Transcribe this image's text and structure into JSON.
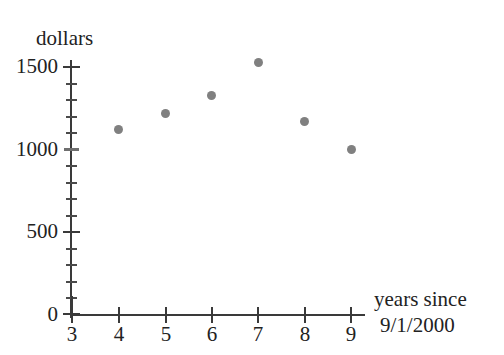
{
  "chart_data": {
    "type": "scatter",
    "title": "",
    "xlabel": "years since 9/1/2000",
    "xlabel_lines": [
      "years since",
      "9/1/2000"
    ],
    "ylabel": "dollars",
    "x": [
      4,
      5,
      6,
      7,
      8,
      9
    ],
    "values": [
      1120,
      1220,
      1330,
      1530,
      1170,
      1000
    ],
    "points": [
      {
        "x": 4,
        "y": 1120
      },
      {
        "x": 5,
        "y": 1220
      },
      {
        "x": 6,
        "y": 1330
      },
      {
        "x": 7,
        "y": 1530
      },
      {
        "x": 8,
        "y": 1170
      },
      {
        "x": 9,
        "y": 1000
      }
    ],
    "xlim": [
      3,
      9.3
    ],
    "ylim": [
      0,
      1550
    ],
    "x_ticks": [
      3,
      4,
      5,
      6,
      7,
      8,
      9
    ],
    "x_tick_labels": [
      "3",
      "4",
      "5",
      "6",
      "7",
      "8",
      "9"
    ],
    "y_ticks": [
      0,
      500,
      1000,
      1500
    ],
    "y_tick_labels": [
      "0",
      "500",
      "1000",
      "1500"
    ],
    "y_minor_tick_step": 100,
    "grid": false,
    "legend": false,
    "marker_color": "#808080",
    "axis_color": "#3a3a3a"
  },
  "axis": {
    "y_title": "dollars",
    "x_title_line1": "years since",
    "x_title_line2": "9/1/2000",
    "y_tick_labels": {
      "t0": "0",
      "t500": "500",
      "t1000": "1000",
      "t1500": "1500"
    },
    "x_tick_labels": {
      "t3": "3",
      "t4": "4",
      "t5": "5",
      "t6": "6",
      "t7": "7",
      "t8": "8",
      "t9": "9"
    }
  }
}
